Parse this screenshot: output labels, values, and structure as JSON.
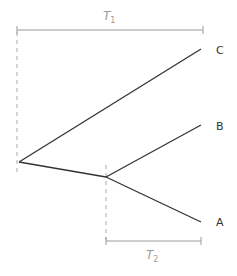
{
  "diagram": {
    "type": "phylogenetic-tree",
    "colors": {
      "branch": "#333333",
      "bracket": "#9a9a9a",
      "guide": "#aaaaaa",
      "label": "#333333"
    },
    "taxa": [
      {
        "id": "C",
        "label": "C"
      },
      {
        "id": "B",
        "label": "B"
      },
      {
        "id": "A",
        "label": "A"
      }
    ],
    "intervals": [
      {
        "id": "T1",
        "letter": "T",
        "subscript": "1"
      },
      {
        "id": "T2",
        "letter": "T",
        "subscript": "2"
      }
    ]
  }
}
